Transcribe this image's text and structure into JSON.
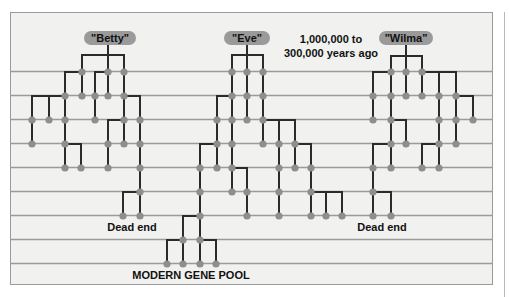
{
  "diagram": {
    "title_note_line1": "1,000,000 to",
    "title_note_line2": "300,000 years ago",
    "dead_end_left": "Dead end",
    "dead_end_right": "Dead end",
    "modern_pool": "MODERN GENE POOL",
    "colors": {
      "background": "#f1f1f0",
      "grid_line": "#9b9b9b",
      "branch": "#2b2b2b",
      "node": "#8e8e8e",
      "pill": "#9a9a9a"
    },
    "grid_rows_y": [
      72,
      96,
      120,
      144,
      168,
      192,
      216,
      240,
      264
    ],
    "ancestors": [
      {
        "name": "\"Betty\"",
        "pill": {
          "x": 110,
          "y": 38,
          "w": 52
        },
        "fate": "dead end",
        "edges": [
          [
            108,
            44,
            108,
            55
          ],
          [
            82,
            55,
            124,
            55
          ],
          [
            82,
            55,
            82,
            72
          ],
          [
            108,
            55,
            108,
            72
          ],
          [
            124,
            55,
            124,
            72
          ],
          [
            82,
            72,
            65,
            72
          ],
          [
            65,
            72,
            65,
            96
          ],
          [
            82,
            72,
            82,
            96
          ],
          [
            95,
            72,
            108,
            72
          ],
          [
            95,
            72,
            95,
            96
          ],
          [
            108,
            72,
            108,
            96
          ],
          [
            124,
            72,
            124,
            96
          ],
          [
            65,
            96,
            32,
            96
          ],
          [
            32,
            96,
            32,
            120
          ],
          [
            49,
            96,
            49,
            120
          ],
          [
            65,
            96,
            65,
            120
          ],
          [
            95,
            96,
            95,
            120
          ],
          [
            124,
            96,
            140,
            96
          ],
          [
            124,
            96,
            124,
            120
          ],
          [
            140,
            96,
            140,
            120
          ],
          [
            32,
            120,
            32,
            144
          ],
          [
            65,
            120,
            65,
            144
          ],
          [
            124,
            120,
            108,
            120
          ],
          [
            108,
            120,
            108,
            144
          ],
          [
            124,
            120,
            124,
            144
          ],
          [
            140,
            120,
            140,
            144
          ],
          [
            65,
            144,
            81,
            144
          ],
          [
            65,
            144,
            65,
            168
          ],
          [
            81,
            144,
            81,
            168
          ],
          [
            108,
            144,
            108,
            168
          ],
          [
            140,
            144,
            140,
            168
          ],
          [
            140,
            168,
            140,
            192
          ],
          [
            140,
            192,
            123,
            192
          ],
          [
            123,
            192,
            123,
            216
          ],
          [
            140,
            192,
            140,
            216
          ]
        ],
        "nodes": [
          [
            82,
            72
          ],
          [
            108,
            72
          ],
          [
            124,
            72
          ],
          [
            65,
            96
          ],
          [
            82,
            96
          ],
          [
            95,
            96
          ],
          [
            108,
            96
          ],
          [
            124,
            96
          ],
          [
            32,
            120
          ],
          [
            49,
            120
          ],
          [
            65,
            120
          ],
          [
            95,
            120
          ],
          [
            124,
            120
          ],
          [
            140,
            120
          ],
          [
            32,
            144
          ],
          [
            65,
            144
          ],
          [
            108,
            144
          ],
          [
            124,
            144
          ],
          [
            140,
            144
          ],
          [
            65,
            168
          ],
          [
            81,
            168
          ],
          [
            108,
            168
          ],
          [
            140,
            168
          ],
          [
            140,
            192
          ],
          [
            123,
            216
          ],
          [
            140,
            216
          ]
        ]
      },
      {
        "name": "\"Eve\"",
        "pill": {
          "x": 247,
          "y": 38,
          "w": 46
        },
        "fate": "modern gene pool",
        "edges": [
          [
            247,
            44,
            247,
            55
          ],
          [
            232,
            55,
            263,
            55
          ],
          [
            232,
            55,
            232,
            72
          ],
          [
            247,
            55,
            247,
            72
          ],
          [
            263,
            55,
            263,
            72
          ],
          [
            232,
            72,
            232,
            96
          ],
          [
            247,
            72,
            247,
            96
          ],
          [
            263,
            72,
            263,
            96
          ],
          [
            232,
            96,
            217,
            96
          ],
          [
            217,
            96,
            217,
            120
          ],
          [
            232,
            96,
            232,
            120
          ],
          [
            247,
            96,
            247,
            120
          ],
          [
            263,
            96,
            263,
            120
          ],
          [
            263,
            120,
            295,
            120
          ],
          [
            279,
            120,
            279,
            144
          ],
          [
            295,
            120,
            295,
            144
          ],
          [
            217,
            120,
            217,
            144
          ],
          [
            232,
            120,
            232,
            144
          ],
          [
            263,
            120,
            263,
            144
          ],
          [
            217,
            144,
            200,
            144
          ],
          [
            200,
            144,
            200,
            168
          ],
          [
            217,
            144,
            217,
            168
          ],
          [
            232,
            144,
            232,
            168
          ],
          [
            295,
            144,
            311,
            144
          ],
          [
            311,
            144,
            311,
            168
          ],
          [
            279,
            144,
            279,
            168
          ],
          [
            295,
            144,
            295,
            168
          ],
          [
            232,
            168,
            247,
            168
          ],
          [
            247,
            168,
            247,
            192
          ],
          [
            232,
            168,
            232,
            192
          ],
          [
            200,
            168,
            200,
            192
          ],
          [
            279,
            168,
            279,
            192
          ],
          [
            311,
            168,
            311,
            192
          ],
          [
            311,
            192,
            342,
            192
          ],
          [
            326,
            192,
            326,
            216
          ],
          [
            342,
            192,
            342,
            216
          ],
          [
            311,
            192,
            311,
            216
          ],
          [
            200,
            192,
            200,
            216
          ],
          [
            247,
            192,
            247,
            216
          ],
          [
            279,
            192,
            279,
            216
          ],
          [
            200,
            216,
            183,
            216
          ],
          [
            183,
            216,
            183,
            240
          ],
          [
            200,
            216,
            200,
            240
          ],
          [
            183,
            240,
            167,
            240
          ],
          [
            167,
            240,
            167,
            264
          ],
          [
            183,
            240,
            183,
            264
          ],
          [
            200,
            240,
            216,
            240
          ],
          [
            216,
            240,
            216,
            264
          ],
          [
            200,
            240,
            200,
            264
          ]
        ],
        "nodes": [
          [
            232,
            72
          ],
          [
            247,
            72
          ],
          [
            263,
            72
          ],
          [
            232,
            96
          ],
          [
            247,
            96
          ],
          [
            263,
            96
          ],
          [
            217,
            120
          ],
          [
            232,
            120
          ],
          [
            247,
            120
          ],
          [
            263,
            120
          ],
          [
            217,
            144
          ],
          [
            232,
            144
          ],
          [
            263,
            144
          ],
          [
            279,
            144
          ],
          [
            295,
            144
          ],
          [
            200,
            168
          ],
          [
            217,
            168
          ],
          [
            232,
            168
          ],
          [
            279,
            168
          ],
          [
            295,
            168
          ],
          [
            311,
            168
          ],
          [
            200,
            192
          ],
          [
            232,
            192
          ],
          [
            247,
            192
          ],
          [
            279,
            192
          ],
          [
            311,
            192
          ],
          [
            200,
            216
          ],
          [
            247,
            216
          ],
          [
            279,
            216
          ],
          [
            311,
            216
          ],
          [
            326,
            216
          ],
          [
            342,
            216
          ],
          [
            183,
            240
          ],
          [
            200,
            240
          ],
          [
            167,
            264
          ],
          [
            183,
            264
          ],
          [
            200,
            264
          ],
          [
            216,
            264
          ]
        ]
      },
      {
        "name": "\"Wilma\"",
        "pill": {
          "x": 406,
          "y": 38,
          "w": 54
        },
        "fate": "dead end",
        "edges": [
          [
            406,
            44,
            406,
            56
          ],
          [
            391,
            56,
            422,
            56
          ],
          [
            391,
            56,
            391,
            72
          ],
          [
            406,
            56,
            406,
            72
          ],
          [
            422,
            56,
            422,
            72
          ],
          [
            391,
            72,
            373,
            72
          ],
          [
            373,
            72,
            373,
            96
          ],
          [
            391,
            72,
            391,
            96
          ],
          [
            406,
            72,
            406,
            96
          ],
          [
            422,
            72,
            422,
            96
          ],
          [
            422,
            72,
            456,
            72
          ],
          [
            439,
            72,
            439,
            96
          ],
          [
            456,
            72,
            456,
            96
          ],
          [
            456,
            96,
            473,
            96
          ],
          [
            473,
            96,
            473,
            120
          ],
          [
            456,
            96,
            456,
            120
          ],
          [
            439,
            96,
            439,
            120
          ],
          [
            373,
            96,
            373,
            120
          ],
          [
            391,
            96,
            391,
            120
          ],
          [
            391,
            120,
            406,
            120
          ],
          [
            406,
            120,
            406,
            144
          ],
          [
            391,
            120,
            391,
            144
          ],
          [
            439,
            120,
            439,
            144
          ],
          [
            456,
            120,
            456,
            144
          ],
          [
            391,
            144,
            373,
            144
          ],
          [
            373,
            144,
            373,
            168
          ],
          [
            391,
            144,
            391,
            168
          ],
          [
            439,
            144,
            422,
            144
          ],
          [
            422,
            144,
            422,
            168
          ],
          [
            439,
            144,
            439,
            168
          ],
          [
            373,
            168,
            373,
            192
          ],
          [
            373,
            192,
            391,
            192
          ],
          [
            391,
            192,
            391,
            216
          ],
          [
            373,
            192,
            373,
            216
          ]
        ],
        "nodes": [
          [
            391,
            72
          ],
          [
            406,
            72
          ],
          [
            422,
            72
          ],
          [
            373,
            96
          ],
          [
            391,
            96
          ],
          [
            406,
            96
          ],
          [
            422,
            96
          ],
          [
            439,
            96
          ],
          [
            456,
            96
          ],
          [
            373,
            120
          ],
          [
            391,
            120
          ],
          [
            439,
            120
          ],
          [
            456,
            120
          ],
          [
            473,
            120
          ],
          [
            391,
            144
          ],
          [
            406,
            144
          ],
          [
            439,
            144
          ],
          [
            456,
            144
          ],
          [
            373,
            168
          ],
          [
            391,
            168
          ],
          [
            422,
            168
          ],
          [
            439,
            168
          ],
          [
            373,
            192
          ],
          [
            373,
            216
          ],
          [
            391,
            216
          ]
        ]
      }
    ]
  }
}
